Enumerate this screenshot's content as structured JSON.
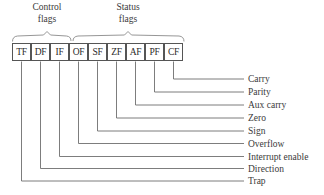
{
  "figure": {
    "groups": [
      {
        "id": "control",
        "label_line1": "Control",
        "label_line2": "flags",
        "spans_flags": [
          "TF",
          "DF",
          "IF"
        ]
      },
      {
        "id": "status",
        "label_line1": "Status",
        "label_line2": "flags",
        "spans_flags": [
          "OF",
          "SF",
          "ZF",
          "AF",
          "PF",
          "CF"
        ]
      }
    ],
    "flags": [
      {
        "abbr": "TF",
        "name": "Trap"
      },
      {
        "abbr": "DF",
        "name": "Direction"
      },
      {
        "abbr": "IF",
        "name": "Interrupt enable"
      },
      {
        "abbr": "OF",
        "name": "Overflow"
      },
      {
        "abbr": "SF",
        "name": "Sign"
      },
      {
        "abbr": "ZF",
        "name": "Zero"
      },
      {
        "abbr": "AF",
        "name": "Aux carry"
      },
      {
        "abbr": "PF",
        "name": "Parity"
      },
      {
        "abbr": "CF",
        "name": "Carry"
      }
    ],
    "callout_order_top_to_bottom": [
      "Carry",
      "Parity",
      "Aux carry",
      "Zero",
      "Sign",
      "Overflow",
      "Interrupt enable",
      "Direction",
      "Trap"
    ],
    "colors": {
      "background": "#ffffff",
      "box_border": "#555555",
      "leader_line": "#6e6e6e",
      "brace": "#8a8a8a",
      "text": "#3a3a3a"
    }
  }
}
